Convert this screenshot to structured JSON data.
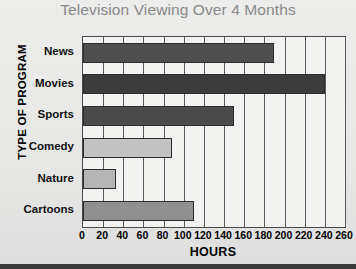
{
  "chart_data": {
    "type": "bar",
    "orientation": "horizontal",
    "title": "Television Viewing Over 4 Months",
    "xlabel": "HOURS",
    "ylabel": "TYPE OF PROGRAM",
    "categories": [
      "News",
      "Movies",
      "Sports",
      "Comedy",
      "Nature",
      "Cartoons"
    ],
    "values": [
      190,
      240,
      150,
      88,
      33,
      110
    ],
    "bar_colors": [
      "#4f4f4f",
      "#3c3c3c",
      "#4a4a4a",
      "#c2c2c2",
      "#b5b5b5",
      "#8f8f8f"
    ],
    "xlim": [
      0,
      260
    ],
    "xticks": [
      0,
      20,
      40,
      60,
      80,
      100,
      120,
      140,
      160,
      180,
      200,
      220,
      240,
      260
    ],
    "xtick_labels": [
      "0",
      "20",
      "40",
      "60",
      "80",
      "100",
      "120",
      "140",
      "160",
      "180",
      "200",
      "220",
      "240",
      "260"
    ],
    "grid": "vertical",
    "legend": "none",
    "title_color": "#8a8a8a",
    "plot_background": "#f2f2f0",
    "figure_background": "#e9e9e7",
    "axis_color": "#4a4a4a"
  }
}
